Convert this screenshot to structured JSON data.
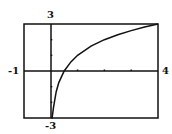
{
  "chart_data": {
    "type": "line",
    "title": "",
    "xlabel": "",
    "ylabel": "",
    "xlim": [
      -1,
      4
    ],
    "ylim": [
      -3,
      3
    ],
    "x_tick_labels": {
      "min": "-1",
      "max": "4"
    },
    "y_tick_labels": {
      "min": "-3",
      "max": "3"
    },
    "x_ticks": [
      1,
      2,
      3
    ],
    "y_ticks": [
      1,
      2,
      -1,
      -2
    ],
    "grid": false,
    "series": [
      {
        "name": "y = 1 + log2(x)",
        "x": [
          0.02,
          0.05,
          0.1,
          0.2,
          0.3,
          0.5,
          0.75,
          1,
          1.5,
          2,
          2.5,
          3,
          3.5,
          4
        ],
        "values": [
          -3,
          -3,
          -2.32,
          -1.32,
          -0.74,
          0,
          0.58,
          1,
          1.58,
          2,
          2.32,
          2.58,
          2.81,
          3
        ]
      }
    ]
  }
}
